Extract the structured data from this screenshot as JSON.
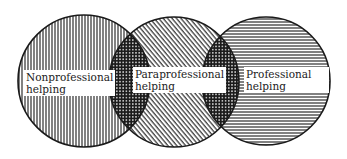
{
  "diagram": {
    "type": "venn",
    "colors": {
      "stroke": "#1a1a1a",
      "background": "#ffffff",
      "label_bg": "#ffffff",
      "text": "#222222"
    },
    "circles": [
      {
        "id": "nonprofessional",
        "label_line1": "Nonprofessional",
        "label_line2": "helping",
        "pattern": "vertical-lines",
        "cx": 84,
        "cy": 81,
        "r": 66
      },
      {
        "id": "paraprofessional",
        "label_line1": "Paraprofessional",
        "label_line2": "helping",
        "pattern": "diagonal-lines",
        "cx": 174,
        "cy": 82,
        "r": 65
      },
      {
        "id": "professional",
        "label_line1": "Professional",
        "label_line2": "helping",
        "pattern": "horizontal-lines",
        "cx": 266,
        "cy": 81,
        "r": 64
      }
    ],
    "overlaps": [
      {
        "between": [
          "nonprofessional",
          "paraprofessional"
        ],
        "pattern": "crosshatch"
      },
      {
        "between": [
          "paraprofessional",
          "professional"
        ],
        "pattern": "crosshatch"
      }
    ]
  }
}
